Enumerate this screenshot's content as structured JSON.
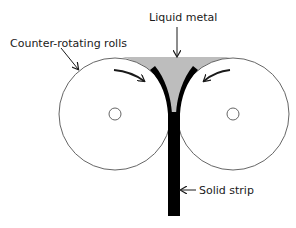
{
  "diagram": {
    "labels": {
      "liquid_metal": "Liquid metal",
      "rolls": "Counter-rotating rolls",
      "strip": "Solid strip"
    },
    "colors": {
      "liquid_metal": "#bdbdbd",
      "strip": "#000000",
      "roll_outline": "#555555",
      "arrow": "#1a1a1a"
    },
    "components": [
      {
        "id": "left-roll",
        "type": "roll",
        "rotation": "clockwise"
      },
      {
        "id": "right-roll",
        "type": "roll",
        "rotation": "counter-clockwise"
      },
      {
        "id": "liquid-metal-pool",
        "type": "melt"
      },
      {
        "id": "solid-strip",
        "type": "product"
      }
    ]
  }
}
